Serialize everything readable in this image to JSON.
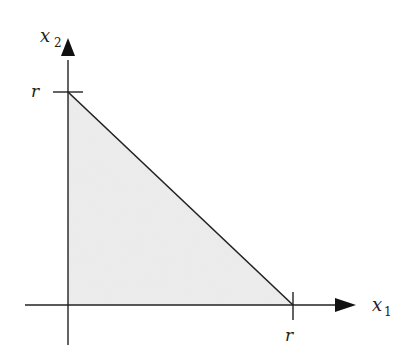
{
  "diagram": {
    "type": "region-plot",
    "colors": {
      "fill": "#ebebeb",
      "stroke": "#222222",
      "background": "#ffffff"
    },
    "axes": {
      "x": {
        "label_main": "x",
        "label_sub": "1",
        "tick_label": "r"
      },
      "y": {
        "label_main": "x",
        "label_sub": "2",
        "tick_label": "r"
      }
    },
    "region": {
      "vertices": [
        [
          "0",
          "0"
        ],
        [
          "r",
          "0"
        ],
        [
          "0",
          "r"
        ]
      ]
    }
  }
}
